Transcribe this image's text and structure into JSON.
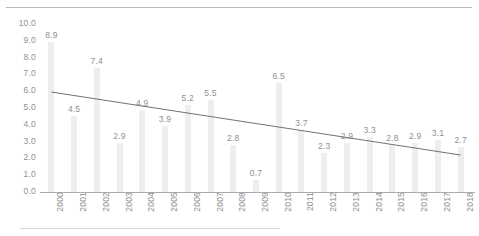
{
  "chart_data": {
    "type": "bar",
    "title": "",
    "subtitle": "",
    "xlabel": "",
    "ylabel": "",
    "categories": [
      "2000",
      "2001",
      "2002",
      "2003",
      "2004",
      "2005",
      "2006",
      "2007",
      "2008",
      "2009",
      "2010",
      "2011",
      "2012",
      "2013",
      "2014",
      "2015",
      "2016",
      "2017",
      "2018"
    ],
    "values": [
      8.9,
      4.5,
      7.4,
      2.9,
      4.9,
      3.9,
      5.2,
      5.5,
      2.8,
      0.7,
      6.5,
      3.7,
      2.3,
      2.9,
      3.3,
      2.8,
      2.9,
      3.1,
      2.7
    ],
    "data_labels": [
      "8.9",
      "4.5",
      "7.4",
      "2.9",
      "4.9",
      "3.9",
      "5.2",
      "5.5",
      "2.8",
      "0.7",
      "6.5",
      "3.7",
      "2.3",
      "2.9",
      "3.3",
      "2.8",
      "2.9",
      "3.1",
      "2.7"
    ],
    "ylim": [
      0,
      10
    ],
    "ytick_labels": [
      "10.0",
      "9.0",
      "8.0",
      "7.0",
      "6.0",
      "5.0",
      "4.0",
      "3.0",
      "2.0",
      "1.0",
      "0.0"
    ],
    "ytick_values": [
      10.0,
      9.0,
      8.0,
      7.0,
      6.0,
      5.0,
      4.0,
      3.0,
      2.0,
      1.0,
      0.0
    ],
    "grid": false,
    "legend": "none",
    "series": [
      {
        "name": "values",
        "type": "bar",
        "values": [
          8.9,
          4.5,
          7.4,
          2.9,
          4.9,
          3.9,
          5.2,
          5.5,
          2.8,
          0.7,
          6.5,
          3.7,
          2.3,
          2.9,
          3.3,
          2.8,
          2.9,
          3.1,
          2.7
        ],
        "color": "#eceeef"
      },
      {
        "name": "trendline",
        "type": "line",
        "start_value": 5.95,
        "end_value": 2.2,
        "color": "#6e7274"
      }
    ],
    "colors": {
      "bar": "#eceeef",
      "trendline": "#6e7274",
      "axis": "#a9adb0",
      "tick_text": "#8d9194",
      "rule": "#b9bcbe",
      "background": "#ffffff"
    }
  }
}
